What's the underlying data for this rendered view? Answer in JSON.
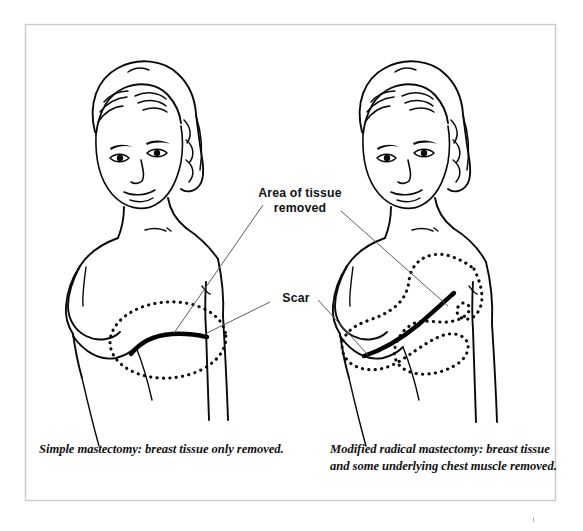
{
  "figure": {
    "kind": "medical-illustration",
    "background_color": "#ffffff",
    "frame_color": "#c9c9c9",
    "ink_color": "#0a0a0a",
    "leader_color": "#56565a"
  },
  "annotations": {
    "area_of_tissue_removed": "Area of tissue\nremoved",
    "scar": "Scar"
  },
  "captions": {
    "left": "Simple mastectomy: breast tissue only removed.",
    "right": "Modified radical mastectomy: breast tissue and some underlying chest muscle removed."
  },
  "panels": [
    {
      "id": "left-panel",
      "name": "simple-mastectomy-figure",
      "caption_key": "left",
      "removed_region_shape": "ellipse",
      "removed_region_description": "dotted oval over the left-side chest where the breast was removed",
      "scar_description": "thick black S-curved horizontal scar inside the dotted oval"
    },
    {
      "id": "right-panel",
      "name": "modified-radical-mastectomy-figure",
      "caption_key": "right",
      "removed_region_shape": "irregular-crescent",
      "removed_region_description": "large dotted crescent region extending from lower chest up toward the armpit",
      "scar_description": "thick black diagonal scar rising toward the armpit inside the dotted region"
    }
  ]
}
